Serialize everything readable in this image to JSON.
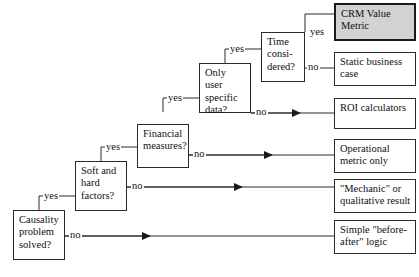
{
  "diagram": {
    "type": "flowchart",
    "edge_labels": {
      "yes": "yes",
      "no": "no"
    },
    "colors": {
      "stroke": "#2b2b2b",
      "text": "#111111",
      "background": "#ffffff",
      "highlight_fill": "#d2d2d2",
      "highlight_stroke": "#1a1a1a"
    },
    "decisions": [
      {
        "id": "causality",
        "label": "Causality\nproblem\nsolved?",
        "yes_label": "yes",
        "no_label": "no"
      },
      {
        "id": "soft-hard",
        "label": "Soft and\nhard\nfactors?",
        "yes_label": "yes",
        "no_label": "no"
      },
      {
        "id": "financial",
        "label": "Financial\nmeasures?",
        "yes_label": "yes",
        "no_label": "no"
      },
      {
        "id": "user-data",
        "label": "Only user\nspecific\ndata?",
        "yes_label": "yes",
        "no_label": "no"
      },
      {
        "id": "time",
        "label": "Time\nconsi-\ndered?",
        "yes_label": "yes",
        "no_label": "no"
      }
    ],
    "outcomes": [
      {
        "id": "crm-value-metric",
        "label": "CRM Value\nMetric",
        "highlight": true
      },
      {
        "id": "static-business",
        "label": "Static business\ncase",
        "highlight": false
      },
      {
        "id": "roi-calculators",
        "label": "ROI calculators",
        "highlight": false
      },
      {
        "id": "operational-metric",
        "label": "Operational\nmetric only",
        "highlight": false
      },
      {
        "id": "mechanic-result",
        "label": "\"Mechanic\" or\nqualitative result",
        "highlight": false
      },
      {
        "id": "before-after-logic",
        "label": "Simple \"before-\nafter\" logic",
        "highlight": false
      }
    ]
  }
}
